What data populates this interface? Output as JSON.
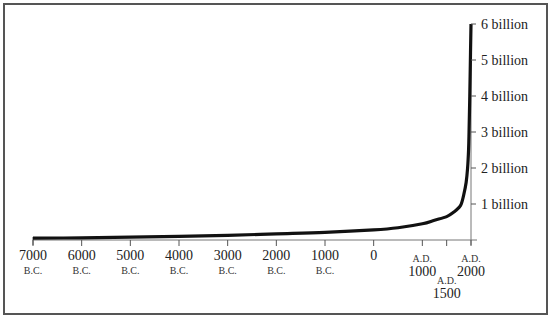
{
  "chart_data": {
    "type": "line",
    "title": "",
    "xlabel": "",
    "ylabel": "",
    "x_range": [
      -7000,
      2000
    ],
    "ylim": [
      0,
      6
    ],
    "y_unit": "billion",
    "grid": false,
    "legend": null,
    "series": [
      {
        "name": "World population",
        "x": [
          -7000,
          -6000,
          -5000,
          -4000,
          -3000,
          -2000,
          -1000,
          0,
          500,
          1000,
          1250,
          1500,
          1650,
          1750,
          1800,
          1850,
          1900,
          1930,
          1950,
          1960,
          1975,
          1990,
          2000
        ],
        "values": [
          0.05,
          0.06,
          0.08,
          0.1,
          0.13,
          0.17,
          0.21,
          0.28,
          0.34,
          0.45,
          0.55,
          0.65,
          0.78,
          0.9,
          1.0,
          1.25,
          1.6,
          2.0,
          2.5,
          3.0,
          4.0,
          5.2,
          6.0
        ]
      }
    ],
    "y_ticks": [
      {
        "value": 1,
        "label": "1 billion"
      },
      {
        "value": 2,
        "label": "2 billion"
      },
      {
        "value": 3,
        "label": "3 billion"
      },
      {
        "value": 4,
        "label": "4 billion"
      },
      {
        "value": 5,
        "label": "5 billion"
      },
      {
        "value": 6,
        "label": "6 billion"
      }
    ],
    "x_ticks": [
      {
        "value": -7000,
        "label": "7000",
        "era": "B.C."
      },
      {
        "value": -6000,
        "label": "6000",
        "era": "B.C."
      },
      {
        "value": -5000,
        "label": "5000",
        "era": "B.C."
      },
      {
        "value": -4000,
        "label": "4000",
        "era": "B.C."
      },
      {
        "value": -3000,
        "label": "3000",
        "era": "B.C."
      },
      {
        "value": -2000,
        "label": "2000",
        "era": "B.C."
      },
      {
        "value": -1000,
        "label": "1000",
        "era": "B.C."
      },
      {
        "value": 0,
        "label": "0",
        "era": ""
      },
      {
        "value": 1000,
        "label": "1000",
        "era": "A.D."
      },
      {
        "value": 1500,
        "label": "1500",
        "era": "A.D.",
        "offset_below": true
      },
      {
        "value": 2000,
        "label": "2000",
        "era": "A.D."
      }
    ]
  }
}
